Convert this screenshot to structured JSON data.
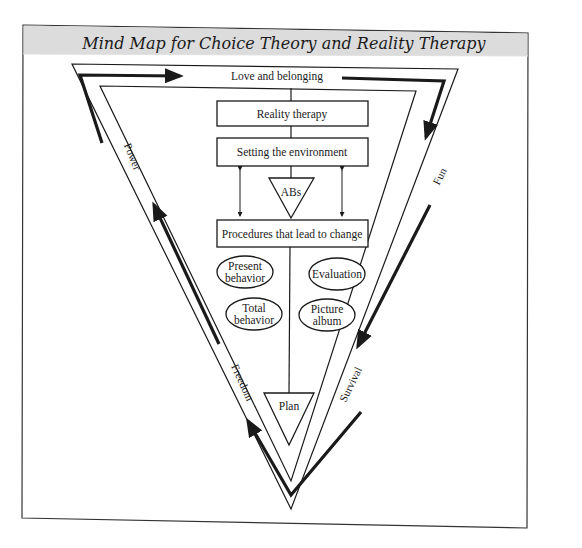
{
  "title": "Mind Map for Choice Theory and Reality Therapy",
  "colors": {
    "header_band": "#dcdcdc",
    "line": "#1a1a1a",
    "background": "#ffffff"
  },
  "needs": {
    "top": "Love and belonging",
    "right_upper": "Fun",
    "right_lower": "Survival",
    "left_lower": "Freedom",
    "left_upper": "Power"
  },
  "flow": {
    "box1": "Reality therapy",
    "box2": "Setting the environment",
    "triangle1": "ABs",
    "box3": "Procedures that lead to change",
    "triangle2": "Plan"
  },
  "ovals": [
    {
      "line1": "Present",
      "line2": "behavior"
    },
    {
      "line1": "Total",
      "line2": "behavior"
    },
    {
      "line1": "Evaluation",
      "line2": ""
    },
    {
      "line1": "Picture",
      "line2": "album"
    }
  ]
}
